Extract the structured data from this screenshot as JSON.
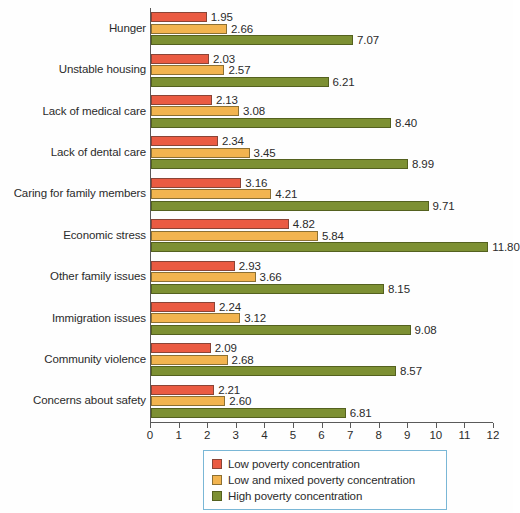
{
  "chart_data": {
    "type": "bar",
    "orientation": "horizontal",
    "title": "",
    "xlabel": "",
    "ylabel": "",
    "xlim": [
      0,
      12
    ],
    "xticks": [
      0,
      1,
      2,
      3,
      4,
      5,
      6,
      7,
      8,
      9,
      10,
      11,
      12
    ],
    "xtick_labels": [
      "0",
      "1",
      "2",
      "3",
      "4",
      "5",
      "6",
      "7",
      "8",
      "9",
      "10",
      "11",
      "12"
    ],
    "grid": false,
    "legend_position": "bottom-center",
    "categories": [
      "Hunger",
      "Unstable housing",
      "Lack of medical care",
      "Lack of dental care",
      "Caring for family members",
      "Economic stress",
      "Other family issues",
      "Immigration issues",
      "Community violence",
      "Concerns about safety"
    ],
    "series": [
      {
        "name": "Low poverty concentration",
        "color": "#ea5b42",
        "values": [
          1.95,
          2.03,
          2.13,
          2.34,
          3.16,
          4.82,
          2.93,
          2.24,
          2.09,
          2.21
        ],
        "labels": [
          "1.95",
          "2.03",
          "2.13",
          "2.34",
          "3.16",
          "4.82",
          "2.93",
          "2.24",
          "2.09",
          "2.21"
        ]
      },
      {
        "name": "Low and mixed poverty concentration",
        "color": "#f2b44f",
        "values": [
          2.66,
          2.57,
          3.08,
          3.45,
          4.21,
          5.84,
          3.66,
          3.12,
          2.68,
          2.6
        ],
        "labels": [
          "2.66",
          "2.57",
          "3.08",
          "3.45",
          "4.21",
          "5.84",
          "3.66",
          "3.12",
          "2.68",
          "2.60"
        ]
      },
      {
        "name": "High poverty concentration",
        "color": "#7d9033",
        "values": [
          7.07,
          6.21,
          8.4,
          8.99,
          9.71,
          11.8,
          8.15,
          9.08,
          8.57,
          6.81
        ],
        "labels": [
          "7.07",
          "6.21",
          "8.40",
          "8.99",
          "9.71",
          "11.80",
          "8.15",
          "9.08",
          "8.57",
          "6.81"
        ]
      }
    ]
  },
  "legend": {
    "items": [
      {
        "label": "Low poverty concentration"
      },
      {
        "label": "Low and mixed poverty concentration"
      },
      {
        "label": "High poverty concentration"
      }
    ]
  }
}
